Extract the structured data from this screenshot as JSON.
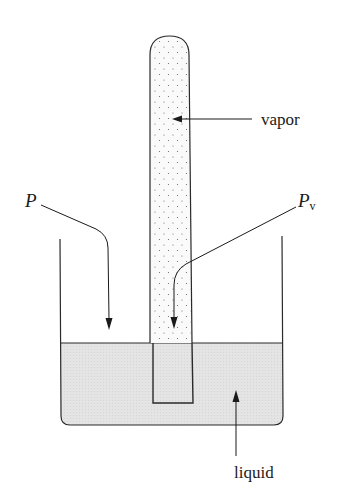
{
  "diagram": {
    "title": "",
    "labels": {
      "vapor": "vapor",
      "pressure": "P",
      "vapor_pressure_main": "P",
      "vapor_pressure_sub": "v",
      "liquid": "liquid"
    },
    "colors": {
      "stroke": "#2a2a2a",
      "liquid_fill": "#e6e6e6",
      "vapor_fill": "#f4f4f4",
      "dots": "#666666"
    }
  }
}
